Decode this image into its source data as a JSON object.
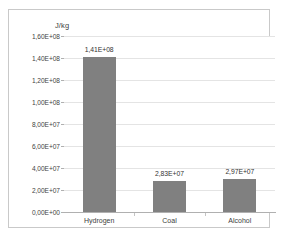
{
  "chart_data": {
    "type": "bar",
    "title": "",
    "ylabel": "J/kg",
    "xlabel": "",
    "categories": [
      "Hydrogen",
      "Coal",
      "Alcohol"
    ],
    "values": [
      141000000,
      28300000,
      29700000
    ],
    "data_labels": [
      "1,41E+08",
      "2,83E+07",
      "2,97E+07"
    ],
    "ylim": [
      0,
      160000000
    ],
    "ytick_values": [
      0,
      20000000,
      40000000,
      60000000,
      80000000,
      100000000,
      120000000,
      140000000,
      160000000
    ],
    "ytick_labels": [
      "0,00E+00",
      "2,00E+07",
      "4,00E+07",
      "6,00E+07",
      "8,00E+07",
      "1,00E+08",
      "1,20E+08",
      "1,40E+08",
      "1,60E+08"
    ],
    "grid": true,
    "legend": false,
    "bar_color": "#808080",
    "gridline_color": "#e4e4e4",
    "axis_color": "#b0b0b0",
    "frame_color": "#c9c9c9",
    "background_color": "#ffffff"
  }
}
